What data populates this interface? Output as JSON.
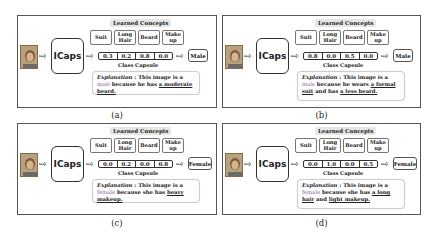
{
  "shared": {
    "lc_title": "Learned Concepts",
    "concepts": [
      "Suit",
      "Long Hair",
      "Beard",
      "Make up"
    ],
    "model": "ICaps",
    "capsule_label": "Class Capsule",
    "explanation_label": "Explanation",
    "colors": {
      "class_word": "#8a6a9a",
      "lc_bg": "#e6e6e6",
      "border": "#555555"
    }
  },
  "panels": [
    {
      "caption": "(a)",
      "capsule": [
        "0.3",
        "0.2",
        "0.8",
        "0.0"
      ],
      "output": "Male",
      "expl": {
        "pre": " : This image is a ",
        "cls": "male",
        "mid": " because he has ",
        "ev1": "a moderate beard.",
        "mid2": "",
        "ev2": ""
      }
    },
    {
      "caption": "(b)",
      "capsule": [
        "0.8",
        "0.0",
        "0.5",
        "0.0"
      ],
      "output": "Male",
      "expl": {
        "pre": " : This image is a ",
        "cls": "male",
        "mid": " because he wears ",
        "ev1": "a formal suit",
        "mid2": " and has ",
        "ev2": "a less beard."
      }
    },
    {
      "caption": "(c)",
      "capsule": [
        "0.0",
        "0.2",
        "0.0",
        "0.8"
      ],
      "output": "Female",
      "expl": {
        "pre": " : This image is a ",
        "cls": "female",
        "mid": " because she has ",
        "ev1": "heavy makeup.",
        "mid2": "",
        "ev2": ""
      }
    },
    {
      "caption": "(d)",
      "capsule": [
        "0.0",
        "1.0",
        "0.0",
        "0.5"
      ],
      "output": "Female",
      "expl": {
        "pre": " : This image is a ",
        "cls": "female",
        "mid": " because she has ",
        "ev1": "a long hair",
        "mid2": " and ",
        "ev2": "light makeup."
      }
    }
  ]
}
